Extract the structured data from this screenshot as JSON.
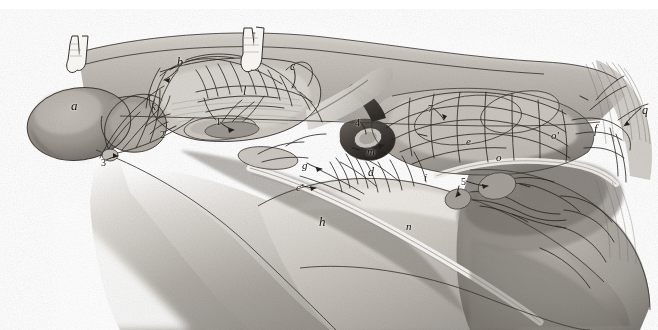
{
  "figure": {
    "kind": "anatomical-lithograph",
    "medium": "pencil / lithograph halftone on white ground",
    "palette": {
      "background": "#ffffff",
      "ink": "#16130f",
      "wash_light": "#dcd8d2",
      "wash_mid": "#b3aea7",
      "wash_dark": "#7d7871",
      "wash_deep": "#4d4945"
    },
    "canvas": {
      "width": 658,
      "height": 330
    }
  },
  "labels": [
    {
      "id": "a",
      "text": "a",
      "x": 71,
      "y": 99,
      "size": 13,
      "leader": false
    },
    {
      "id": "b",
      "text": "b",
      "x": 177,
      "y": 56,
      "size": 12,
      "leader": true
    },
    {
      "id": "c",
      "text": "c",
      "x": 290,
      "y": 60,
      "size": 12,
      "leader": true
    },
    {
      "id": "k",
      "text": "k",
      "x": 151,
      "y": 101,
      "size": 11,
      "leader": false
    },
    {
      "id": "l",
      "text": "l",
      "x": 243,
      "y": 85,
      "size": 12,
      "leader": false
    },
    {
      "id": "d",
      "text": "d",
      "x": 368,
      "y": 166,
      "size": 12,
      "leader": false
    },
    {
      "id": "m",
      "text": "m",
      "x": 367,
      "y": 146,
      "size": 11,
      "leader": true
    },
    {
      "id": "e",
      "text": "e",
      "x": 466,
      "y": 136,
      "size": 11,
      "leader": false
    },
    {
      "id": "f",
      "text": "f",
      "x": 594,
      "y": 123,
      "size": 12,
      "leader": false
    },
    {
      "id": "g",
      "text": "g",
      "x": 302,
      "y": 160,
      "size": 11,
      "leader": true
    },
    {
      "id": "cprime",
      "text": "c'",
      "x": 296,
      "y": 182,
      "size": 11,
      "leader": true
    },
    {
      "id": "h",
      "text": "h",
      "x": 319,
      "y": 215,
      "size": 13,
      "leader": false
    },
    {
      "id": "n",
      "text": "n",
      "x": 406,
      "y": 221,
      "size": 11,
      "leader": false
    },
    {
      "id": "i",
      "text": "i",
      "x": 424,
      "y": 172,
      "size": 11,
      "leader": false
    },
    {
      "id": "o",
      "text": "o",
      "x": 496,
      "y": 152,
      "size": 11,
      "leader": false
    },
    {
      "id": "oprime",
      "text": "o'",
      "x": 551,
      "y": 130,
      "size": 11,
      "leader": false
    },
    {
      "id": "q",
      "text": "q",
      "x": 642,
      "y": 104,
      "size": 12,
      "leader": true
    },
    {
      "id": "1",
      "text": "1",
      "x": 216,
      "y": 117,
      "size": 10,
      "leader": true
    },
    {
      "id": "2",
      "text": "2",
      "x": 160,
      "y": 130,
      "size": 10,
      "leader": true
    },
    {
      "id": "3",
      "text": "3",
      "x": 101,
      "y": 158,
      "size": 10,
      "leader": true
    },
    {
      "id": "4",
      "text": "4",
      "x": 355,
      "y": 118,
      "size": 10,
      "leader": true
    },
    {
      "id": "5",
      "text": "5",
      "x": 461,
      "y": 177,
      "size": 10,
      "leader": true
    },
    {
      "id": "7",
      "text": "7",
      "x": 428,
      "y": 104,
      "size": 10,
      "leader": true
    }
  ]
}
